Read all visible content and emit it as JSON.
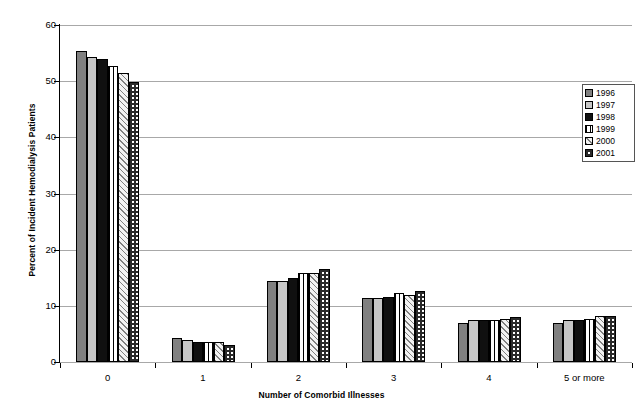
{
  "chart_data": {
    "type": "bar",
    "title": "",
    "subtitle": "",
    "xlabel": "Number of Comorbid Illnesses",
    "ylabel": "Percent of Incident Hemodialysis Patients",
    "categories": [
      "0",
      "1",
      "2",
      "3",
      "4",
      "5 or more"
    ],
    "ylim": [
      0,
      60
    ],
    "yticks": [
      0,
      10,
      20,
      30,
      40,
      50,
      60
    ],
    "ytick_labels": [
      "0",
      "10",
      "20",
      "30",
      "40",
      "50",
      "60"
    ],
    "grid": true,
    "legend_position": "right",
    "series": [
      {
        "name": "1996",
        "pattern": "solid-gray",
        "color": "#808080",
        "values": [
          55.4,
          4.2,
          14.4,
          11.4,
          7.0,
          6.9
        ]
      },
      {
        "name": "1997",
        "pattern": "solid-light-gray",
        "color": "#c6c6c6",
        "values": [
          54.3,
          4.0,
          14.4,
          11.4,
          7.5,
          7.5
        ]
      },
      {
        "name": "1998",
        "pattern": "solid-black",
        "color": "#101010",
        "values": [
          53.9,
          3.5,
          14.9,
          11.6,
          7.5,
          7.5
        ]
      },
      {
        "name": "1999",
        "pattern": "vertical-lines",
        "color": "#ffffff",
        "values": [
          52.7,
          3.6,
          15.8,
          12.2,
          7.4,
          7.6
        ]
      },
      {
        "name": "2000",
        "pattern": "diagonal-hatch",
        "color": "#f0f0f0",
        "values": [
          51.4,
          3.5,
          15.9,
          12.0,
          7.7,
          8.2
        ]
      },
      {
        "name": "2001",
        "pattern": "checkerboard",
        "color": "#ffffff",
        "values": [
          49.9,
          3.1,
          16.5,
          12.7,
          8.0,
          8.2
        ]
      }
    ]
  },
  "legend": {
    "entries": [
      {
        "label": "1996"
      },
      {
        "label": "1997"
      },
      {
        "label": "1998"
      },
      {
        "label": "1999"
      },
      {
        "label": "2000"
      },
      {
        "label": "2001"
      }
    ]
  }
}
